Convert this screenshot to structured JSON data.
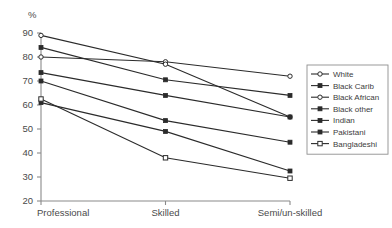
{
  "chart_data": {
    "type": "line",
    "title": "",
    "subtitle": "",
    "xlabel": "",
    "ylabel": "%",
    "categories": [
      "Professional",
      "Skilled",
      "Semi/un-skilled"
    ],
    "ylim": [
      20,
      90
    ],
    "yticks": [
      20,
      30,
      40,
      50,
      60,
      70,
      80,
      90
    ],
    "ytick_labels": [
      "20",
      "30",
      "40",
      "50",
      "60",
      "70",
      "80",
      "90"
    ],
    "grid": false,
    "legend_position": "right",
    "series": [
      {
        "name": "White",
        "marker": "open-circle",
        "values": [
          80,
          78,
          72
        ]
      },
      {
        "name": "Black Carib",
        "marker": "solid-square",
        "values": [
          84,
          70.5,
          64
        ]
      },
      {
        "name": "Black African",
        "marker": "open-circle",
        "values": [
          89,
          77,
          55
        ]
      },
      {
        "name": "Black other",
        "marker": "solid-square",
        "values": [
          73.5,
          64,
          55
        ]
      },
      {
        "name": "Indian",
        "marker": "solid-square",
        "values": [
          70,
          53.5,
          44.5
        ]
      },
      {
        "name": "Pakistani",
        "marker": "solid-square",
        "values": [
          61,
          49,
          32.5
        ]
      },
      {
        "name": "Bangladeshi",
        "marker": "open-square",
        "values": [
          62.5,
          38,
          29.5
        ]
      }
    ]
  },
  "axis": {
    "unit_label": "%"
  },
  "colors": {
    "line": "#2b2b2b",
    "axis": "#8a8a8a",
    "text": "#3d3d3d",
    "background": "#ffffff"
  }
}
